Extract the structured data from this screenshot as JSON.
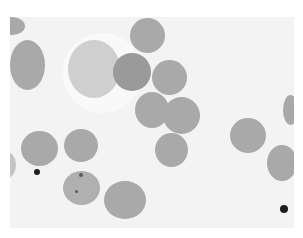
{
  "image": {
    "description": "Grayscale light micrograph of a blood smear showing red blood cells, a pale ghost/white cell, and one cell with inclusions",
    "colors": {
      "background": "#f3f3f3",
      "border": "#ffffff",
      "cell": "#a9a9a9",
      "cell_dark": "#9a9a9a",
      "ghost_cell": "#cfcfcf",
      "debris": "#1e1e1e"
    },
    "cells": [
      {
        "id": "c1",
        "x": 0,
        "y": 17,
        "w": 25,
        "h": 18,
        "tone": "normal"
      },
      {
        "id": "c2",
        "x": 10,
        "y": 40,
        "w": 35,
        "h": 50,
        "tone": "normal"
      },
      {
        "id": "c3",
        "x": 130,
        "y": 18,
        "w": 35,
        "h": 35,
        "tone": "normal"
      },
      {
        "id": "c4",
        "x": 113,
        "y": 53,
        "w": 38,
        "h": 38,
        "tone": "dark"
      },
      {
        "id": "c5",
        "x": 152,
        "y": 60,
        "w": 35,
        "h": 35,
        "tone": "normal"
      },
      {
        "id": "c6",
        "x": 135,
        "y": 92,
        "w": 34,
        "h": 36,
        "tone": "normal"
      },
      {
        "id": "c7",
        "x": 163,
        "y": 97,
        "w": 37,
        "h": 37,
        "tone": "normal"
      },
      {
        "id": "c8",
        "x": 155,
        "y": 133,
        "w": 33,
        "h": 34,
        "tone": "normal"
      },
      {
        "id": "c9",
        "x": 230,
        "y": 118,
        "w": 36,
        "h": 35,
        "tone": "normal"
      },
      {
        "id": "c10",
        "x": 267,
        "y": 145,
        "w": 30,
        "h": 36,
        "tone": "normal"
      },
      {
        "id": "c11",
        "x": 283,
        "y": 95,
        "w": 15,
        "h": 30,
        "tone": "normal"
      },
      {
        "id": "c12",
        "x": 21,
        "y": 131,
        "w": 37,
        "h": 35,
        "tone": "normal"
      },
      {
        "id": "c13",
        "x": 64,
        "y": 129,
        "w": 34,
        "h": 33,
        "tone": "normal"
      },
      {
        "id": "c14",
        "x": 63,
        "y": 171,
        "w": 37,
        "h": 34,
        "tone": "inclusion"
      },
      {
        "id": "c15",
        "x": 104,
        "y": 181,
        "w": 42,
        "h": 38,
        "tone": "normal"
      }
    ],
    "ghost_cell": {
      "x": 68,
      "y": 40,
      "w": 52,
      "h": 58
    },
    "debris": [
      {
        "x": 34,
        "y": 169,
        "w": 6,
        "h": 6
      },
      {
        "x": 280,
        "y": 205,
        "w": 8,
        "h": 8
      }
    ]
  }
}
